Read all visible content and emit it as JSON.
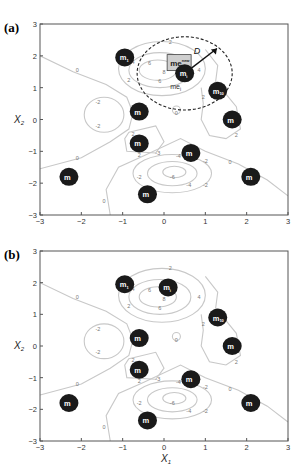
{
  "figure": {
    "panels": [
      {
        "id": "a",
        "label": "(a)",
        "top": 0,
        "axes": {
          "left": 40,
          "right": 288,
          "top": 24,
          "bottom": 215
        },
        "show_circle": true
      },
      {
        "id": "b",
        "label": "(b)",
        "top": 227,
        "axes": {
          "left": 40,
          "right": 288,
          "top": 24,
          "bottom": 214
        },
        "show_circle": false
      }
    ],
    "xlabel": "X",
    "xlabel_sub": "1",
    "ylabel": "X",
    "ylabel_sub": "2",
    "xticks": [
      "-3",
      "-2",
      "-1",
      "0",
      "1",
      "2",
      "3"
    ],
    "yticks": [
      "3",
      "2",
      "1",
      "0",
      "-1",
      "-2",
      "-3"
    ],
    "annotations": {
      "new_box_label": "me",
      "new_box_sup": "new",
      "radius_label": "D",
      "existing_label": "me",
      "existing_sub": "i"
    },
    "colors": {
      "node": "#1a1a1a",
      "node_text": "#ffffff",
      "contour": "#c8c8c8",
      "contour_label": "#777777",
      "axis": "#555555",
      "box_fill": "#cfcfcf"
    }
  },
  "chart_data": [
    {
      "type": "scatter",
      "title": "(a)",
      "xlabel": "X1",
      "ylabel": "X2",
      "xlim": [
        -3,
        3
      ],
      "ylim": [
        -3,
        3
      ],
      "grid": false,
      "description": "Contour plot of a 2D landscape with labeled contour levels (-6,-4,-2,0,2,4,6) and 10 cluster-center nodes; a new point me^new lies inside a dashed circle of radius D centered on node m_i (center of me_i).",
      "contour_levels": [
        -6,
        -4,
        -2,
        0,
        2,
        4,
        6
      ],
      "nodes": [
        {
          "label": "m1",
          "x": -0.95,
          "y": 1.95
        },
        {
          "label": "mi",
          "x": 0.5,
          "y": 1.45
        },
        {
          "label": "m10",
          "x": 1.3,
          "y": 0.9
        },
        {
          "label": "m",
          "x": 1.65,
          "y": 0.0
        },
        {
          "label": "m",
          "x": -0.6,
          "y": 0.25
        },
        {
          "label": "m",
          "x": -0.6,
          "y": -0.75
        },
        {
          "label": "m",
          "x": 0.65,
          "y": -1.05
        },
        {
          "label": "m",
          "x": -2.3,
          "y": -1.8
        },
        {
          "label": "m",
          "x": -0.4,
          "y": -2.35
        },
        {
          "label": "m",
          "x": 2.1,
          "y": -1.8
        }
      ],
      "new_point": {
        "label": "me_new",
        "x": 0.1,
        "y": 1.85
      },
      "circle": {
        "cx": 0.5,
        "cy": 1.45,
        "radius_label": "D",
        "r": 1.15
      }
    },
    {
      "type": "scatter",
      "title": "(b)",
      "xlabel": "X1",
      "ylabel": "X2",
      "xlim": [
        -3,
        3
      ],
      "ylim": [
        -3,
        3
      ],
      "grid": false,
      "description": "Same contour landscape after update; node mi has moved to the new point location.",
      "contour_levels": [
        -6,
        -4,
        -2,
        0,
        2,
        4,
        6
      ],
      "nodes": [
        {
          "label": "m1",
          "x": -0.95,
          "y": 1.95
        },
        {
          "label": "mi",
          "x": 0.1,
          "y": 1.85
        },
        {
          "label": "m10",
          "x": 1.3,
          "y": 0.9
        },
        {
          "label": "m",
          "x": 1.65,
          "y": 0.0
        },
        {
          "label": "m",
          "x": -0.6,
          "y": 0.25
        },
        {
          "label": "m",
          "x": -0.6,
          "y": -0.75
        },
        {
          "label": "m",
          "x": 0.65,
          "y": -1.05
        },
        {
          "label": "m",
          "x": -2.3,
          "y": -1.8
        },
        {
          "label": "m",
          "x": -0.4,
          "y": -2.35
        },
        {
          "label": "m",
          "x": 2.1,
          "y": -1.8
        }
      ]
    }
  ]
}
